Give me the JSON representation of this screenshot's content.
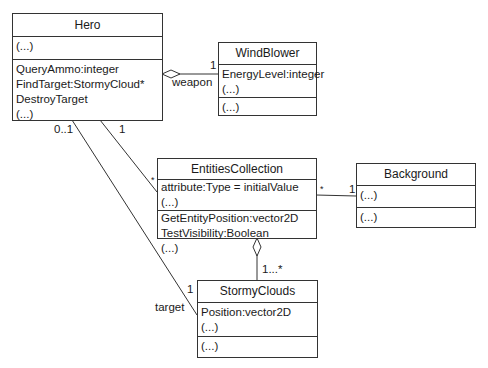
{
  "classes": {
    "hero": {
      "name": "Hero",
      "attributes": [
        "(...)"
      ],
      "operations": [
        "QueryAmmo:integer",
        "FindTarget:StormyCloud*",
        "DestroyTarget",
        "(...)"
      ]
    },
    "windblower": {
      "name": "WindBlower",
      "attributes": [
        "EnergyLevel:integer",
        "(...)"
      ],
      "operations": [
        "(...)"
      ]
    },
    "entities": {
      "name": "EntitiesCollection",
      "attributes": [
        "attribute:Type = initialValue",
        "(...)"
      ],
      "operations": [
        "GetEntityPosition:vector2D",
        "TestVisibility:Boolean",
        "(...)"
      ]
    },
    "background": {
      "name": "Background",
      "attributes": [
        "(...)"
      ],
      "operations": [
        "(...)"
      ]
    },
    "stormy": {
      "name": "StormyClouds",
      "attributes": [
        "Position:vector2D",
        "(...)"
      ],
      "operations": [
        "(...)"
      ]
    }
  },
  "associations": {
    "hero_windblower": {
      "type": "aggregation",
      "role": "weapon",
      "mult_target": "1"
    },
    "hero_entities": {
      "type": "association",
      "mult_source": "1",
      "mult_target": "*"
    },
    "hero_stormy": {
      "type": "association",
      "mult_source": "0..1",
      "mult_target": "1",
      "role": "target"
    },
    "entities_background": {
      "type": "association",
      "mult_source": "*",
      "mult_target": "1"
    },
    "entities_stormy": {
      "type": "aggregation",
      "mult_target": "1...*"
    }
  }
}
